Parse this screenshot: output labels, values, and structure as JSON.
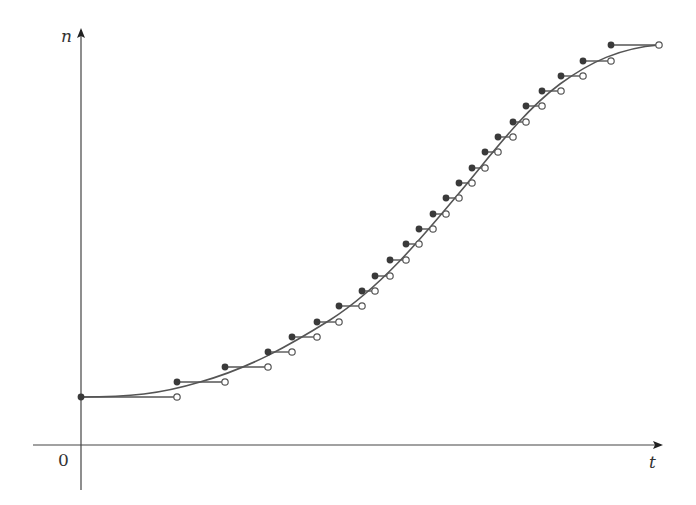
{
  "diagram": {
    "type": "step-function-approximation",
    "axes": {
      "x_label": "t",
      "y_label": "n",
      "origin_label": "0",
      "origin_px": [
        81,
        445
      ],
      "x_axis": {
        "y": 445,
        "x_start": 33,
        "x_end": 661
      },
      "y_axis": {
        "x": 81,
        "y_start": 490,
        "y_end": 30
      }
    },
    "colors": {
      "axis": "#444444",
      "curve": "#555555",
      "step": "#555555",
      "filled_dot": "#3a3a3a",
      "open_dot_fill": "#ffffff",
      "open_dot_stroke": "#555555",
      "text": "#333333"
    },
    "steps": [
      {
        "x0": 81,
        "x1": 177,
        "y": 397
      },
      {
        "x0": 177,
        "x1": 225,
        "y": 382
      },
      {
        "x0": 225,
        "x1": 268,
        "y": 367
      },
      {
        "x0": 268,
        "x1": 292,
        "y": 352
      },
      {
        "x0": 292,
        "x1": 317,
        "y": 337
      },
      {
        "x0": 317,
        "x1": 339,
        "y": 322
      },
      {
        "x0": 339,
        "x1": 362,
        "y": 306
      },
      {
        "x0": 362,
        "x1": 375,
        "y": 291
      },
      {
        "x0": 375,
        "x1": 390,
        "y": 276
      },
      {
        "x0": 390,
        "x1": 406,
        "y": 260
      },
      {
        "x0": 406,
        "x1": 419,
        "y": 244
      },
      {
        "x0": 419,
        "x1": 433,
        "y": 229
      },
      {
        "x0": 433,
        "x1": 446,
        "y": 214
      },
      {
        "x0": 446,
        "x1": 459,
        "y": 198
      },
      {
        "x0": 459,
        "x1": 472,
        "y": 183
      },
      {
        "x0": 472,
        "x1": 485,
        "y": 168
      },
      {
        "x0": 485,
        "x1": 498,
        "y": 152
      },
      {
        "x0": 498,
        "x1": 513,
        "y": 137
      },
      {
        "x0": 513,
        "x1": 526,
        "y": 122
      },
      {
        "x0": 526,
        "x1": 542,
        "y": 106
      },
      {
        "x0": 542,
        "x1": 561,
        "y": 91
      },
      {
        "x0": 561,
        "x1": 583,
        "y": 76
      },
      {
        "x0": 583,
        "x1": 611,
        "y": 61
      },
      {
        "x0": 611,
        "x1": 659,
        "y": 45
      }
    ],
    "curve_path": "M81,397 C130,397 160,394 200,382 C250,368 290,345 330,320 C380,288 420,240 460,192 C495,150 525,110 560,84 C590,62 620,48 659,45"
  }
}
